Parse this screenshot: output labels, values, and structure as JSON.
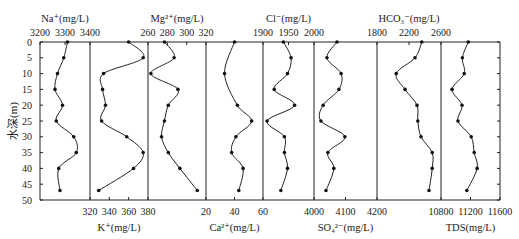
{
  "chart_data": {
    "type": "line",
    "layout": "multi-panel vertical profiles sharing depth axis",
    "ylabel": "水深(m)",
    "y_ticks": [
      0,
      5,
      10,
      15,
      20,
      25,
      30,
      35,
      40,
      45,
      50
    ],
    "ylim": [
      0,
      50
    ],
    "depths": [
      0,
      5,
      10,
      15,
      20,
      25,
      30,
      35,
      40,
      47
    ],
    "panels": [
      {
        "name": "Na+",
        "label": "Na⁺(mg/L)",
        "axis": "top",
        "xlim": [
          3200,
          3400
        ],
        "ticks": [
          3200,
          3300,
          3400
        ],
        "values": [
          3310,
          3295,
          3270,
          3260,
          3290,
          3265,
          3335,
          3345,
          3275,
          3280
        ]
      },
      {
        "name": "K+",
        "label": "K⁺(mg/L)",
        "axis": "bottom",
        "xlim": [
          320,
          380
        ],
        "ticks": [
          320,
          340,
          360,
          380
        ],
        "values": [
          360,
          375,
          334,
          333,
          336,
          332,
          358,
          375,
          365,
          329
        ]
      },
      {
        "name": "Mg2+",
        "label": "Mg²⁺(mg/L)",
        "axis": "top",
        "xlim": [
          260,
          320
        ],
        "ticks": [
          260,
          280,
          300,
          320
        ],
        "values": [
          277,
          287,
          263,
          291,
          281,
          277,
          274,
          281,
          293,
          311
        ]
      },
      {
        "name": "Ca2+",
        "label": "Ca²⁺(mg/L)",
        "axis": "bottom",
        "xlim": [
          20,
          60
        ],
        "ticks": [
          20,
          40,
          60
        ],
        "depths": [
          0,
          10,
          20,
          25,
          30,
          35,
          40,
          47
        ],
        "values": [
          40,
          33,
          42,
          52,
          41,
          38,
          46,
          43
        ]
      },
      {
        "name": "Cl-",
        "label": "Cl⁻(mg/L)",
        "axis": "top",
        "xlim": [
          1900,
          2000
        ],
        "ticks": [
          1900,
          1950,
          2000
        ],
        "values": [
          1940,
          1955,
          1948,
          1922,
          1962,
          1908,
          1942,
          1942,
          1948,
          1935
        ]
      },
      {
        "name": "SO4 2-",
        "label": "SO₄²⁻(mg/L)",
        "axis": "bottom",
        "xlim": [
          4000,
          4200
        ],
        "ticks": [
          4000,
          4100,
          4200
        ],
        "values": [
          4073,
          4041,
          4086,
          4079,
          4029,
          4022,
          4098,
          4044,
          4063,
          4038
        ]
      },
      {
        "name": "HCO3-",
        "label": "HCO₃⁻(mg/L)",
        "axis": "top",
        "xlim": [
          1800,
          2600
        ],
        "ticks": [
          1800,
          2200,
          2600
        ],
        "values": [
          2360,
          2275,
          2040,
          2150,
          2300,
          2310,
          2350,
          2490,
          2490,
          2450
        ]
      },
      {
        "name": "TDS",
        "label": "TDS(mg/L)",
        "axis": "bottom",
        "xlim": [
          10800,
          11600
        ],
        "ticks": [
          10800,
          11200,
          11600
        ],
        "values": [
          11170,
          11090,
          11115,
          10950,
          11085,
          11030,
          11210,
          11250,
          11290,
          11150
        ]
      }
    ]
  },
  "plot": {
    "y_top_px": 42,
    "y_bottom_px": 200,
    "panel_edges_px": [
      124,
      181,
      239,
      297,
      355,
      405,
      466,
      530,
      590
    ],
    "scale": 0.86,
    "offset_x": -67
  }
}
